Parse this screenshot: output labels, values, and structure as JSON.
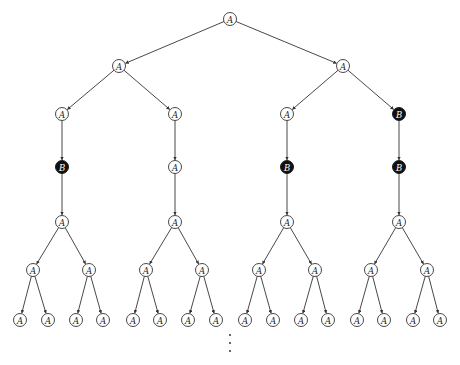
{
  "diagram": {
    "type": "tree",
    "node_radius": 6.5,
    "colors": {
      "a_fill": "#ffffff",
      "b_fill": "#111111",
      "stroke": "#333333"
    },
    "labels": {
      "A": "A",
      "B": "B"
    },
    "nodes": [
      {
        "id": "root",
        "label": "A",
        "x": 230,
        "y": 19
      },
      {
        "id": "l1",
        "label": "A",
        "x": 119,
        "y": 66
      },
      {
        "id": "r1",
        "label": "A",
        "x": 343,
        "y": 66
      },
      {
        "id": "l1l",
        "label": "A",
        "x": 62,
        "y": 114
      },
      {
        "id": "l1r",
        "label": "A",
        "x": 175,
        "y": 114
      },
      {
        "id": "r1l",
        "label": "A",
        "x": 287,
        "y": 114
      },
      {
        "id": "r1r",
        "label": "B",
        "x": 399,
        "y": 114
      },
      {
        "id": "b1",
        "label": "B",
        "x": 62,
        "y": 167
      },
      {
        "id": "b2",
        "label": "A",
        "x": 175,
        "y": 167
      },
      {
        "id": "b3",
        "label": "B",
        "x": 287,
        "y": 167
      },
      {
        "id": "b4",
        "label": "B",
        "x": 399,
        "y": 167
      },
      {
        "id": "c1",
        "label": "A",
        "x": 62,
        "y": 222
      },
      {
        "id": "c2",
        "label": "A",
        "x": 175,
        "y": 222
      },
      {
        "id": "c3",
        "label": "A",
        "x": 287,
        "y": 222
      },
      {
        "id": "c4",
        "label": "A",
        "x": 399,
        "y": 222
      },
      {
        "id": "d1",
        "label": "A",
        "x": 33,
        "y": 270
      },
      {
        "id": "d2",
        "label": "A",
        "x": 89,
        "y": 270
      },
      {
        "id": "d3",
        "label": "A",
        "x": 146,
        "y": 270
      },
      {
        "id": "d4",
        "label": "A",
        "x": 202,
        "y": 270
      },
      {
        "id": "d5",
        "label": "A",
        "x": 259,
        "y": 270
      },
      {
        "id": "d6",
        "label": "A",
        "x": 315,
        "y": 270
      },
      {
        "id": "d7",
        "label": "A",
        "x": 371,
        "y": 270
      },
      {
        "id": "d8",
        "label": "A",
        "x": 427,
        "y": 270
      },
      {
        "id": "e1",
        "label": "A",
        "x": 20,
        "y": 320
      },
      {
        "id": "e2",
        "label": "A",
        "x": 48,
        "y": 320
      },
      {
        "id": "e3",
        "label": "A",
        "x": 76,
        "y": 320
      },
      {
        "id": "e4",
        "label": "A",
        "x": 103,
        "y": 320
      },
      {
        "id": "e5",
        "label": "A",
        "x": 133,
        "y": 320
      },
      {
        "id": "e6",
        "label": "A",
        "x": 160,
        "y": 320
      },
      {
        "id": "e7",
        "label": "A",
        "x": 188,
        "y": 320
      },
      {
        "id": "e8",
        "label": "A",
        "x": 216,
        "y": 320
      },
      {
        "id": "e9",
        "label": "A",
        "x": 245,
        "y": 320
      },
      {
        "id": "e10",
        "label": "A",
        "x": 273,
        "y": 320
      },
      {
        "id": "e11",
        "label": "A",
        "x": 301,
        "y": 320
      },
      {
        "id": "e12",
        "label": "A",
        "x": 328,
        "y": 320
      },
      {
        "id": "e13",
        "label": "A",
        "x": 357,
        "y": 320
      },
      {
        "id": "e14",
        "label": "A",
        "x": 384,
        "y": 320
      },
      {
        "id": "e15",
        "label": "A",
        "x": 413,
        "y": 320
      },
      {
        "id": "e16",
        "label": "A",
        "x": 440,
        "y": 320
      }
    ],
    "edges": [
      [
        "root",
        "l1"
      ],
      [
        "root",
        "r1"
      ],
      [
        "l1",
        "l1l"
      ],
      [
        "l1",
        "l1r"
      ],
      [
        "r1",
        "r1l"
      ],
      [
        "r1",
        "r1r"
      ],
      [
        "l1l",
        "b1"
      ],
      [
        "l1r",
        "b2"
      ],
      [
        "r1l",
        "b3"
      ],
      [
        "r1r",
        "b4"
      ],
      [
        "b1",
        "c1"
      ],
      [
        "b2",
        "c2"
      ],
      [
        "b3",
        "c3"
      ],
      [
        "b4",
        "c4"
      ],
      [
        "c1",
        "d1"
      ],
      [
        "c1",
        "d2"
      ],
      [
        "c2",
        "d3"
      ],
      [
        "c2",
        "d4"
      ],
      [
        "c3",
        "d5"
      ],
      [
        "c3",
        "d6"
      ],
      [
        "c4",
        "d7"
      ],
      [
        "c4",
        "d8"
      ],
      [
        "d1",
        "e1"
      ],
      [
        "d1",
        "e2"
      ],
      [
        "d2",
        "e3"
      ],
      [
        "d2",
        "e4"
      ],
      [
        "d3",
        "e5"
      ],
      [
        "d3",
        "e6"
      ],
      [
        "d4",
        "e7"
      ],
      [
        "d4",
        "e8"
      ],
      [
        "d5",
        "e9"
      ],
      [
        "d5",
        "e10"
      ],
      [
        "d6",
        "e11"
      ],
      [
        "d6",
        "e12"
      ],
      [
        "d7",
        "e13"
      ],
      [
        "d7",
        "e14"
      ],
      [
        "d8",
        "e15"
      ],
      [
        "d8",
        "e16"
      ]
    ],
    "continuation": {
      "symbol": "⋮",
      "x": 230,
      "dots_y": [
        335,
        343,
        351
      ]
    }
  }
}
